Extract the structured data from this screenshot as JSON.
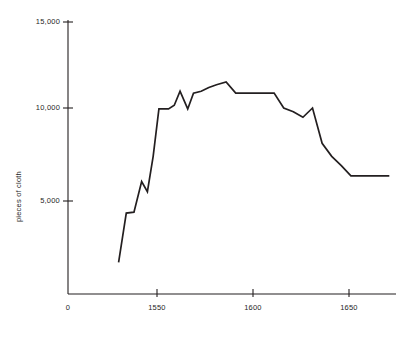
{
  "chart_data": {
    "type": "line",
    "title": "",
    "subtitle": "",
    "xlabel": "",
    "ylabel": "pieces of cloth",
    "xlim": [
      1528,
      1672
    ],
    "ylim": [
      0,
      15000
    ],
    "grid": false,
    "legend": null,
    "x_ticks": [
      {
        "value": 0,
        "label": "0"
      },
      {
        "value": 1550,
        "label": "1550"
      },
      {
        "value": 1600,
        "label": "1600"
      },
      {
        "value": 1650,
        "label": "1650"
      }
    ],
    "y_ticks": [
      {
        "value": 5000,
        "label": "5,000"
      },
      {
        "value": 10000,
        "label": "10,000"
      },
      {
        "value": 15000,
        "label": "15,000"
      }
    ],
    "series": [
      {
        "name": "pieces of cloth",
        "color": "#231f20",
        "x": [
          1530,
          1534,
          1538,
          1542,
          1545,
          1548,
          1551,
          1556,
          1559,
          1562,
          1566,
          1569,
          1573,
          1577,
          1581,
          1586,
          1591,
          1596,
          1601,
          1606,
          1611,
          1616,
          1621,
          1626,
          1631,
          1636,
          1641,
          1646,
          1651,
          1656,
          1661,
          1666,
          1671
        ],
        "y": [
          1700,
          4350,
          4400,
          6050,
          5500,
          7400,
          9950,
          9950,
          10150,
          10900,
          9950,
          10800,
          10900,
          11100,
          11250,
          11400,
          10800,
          10800,
          10800,
          10800,
          10800,
          10000,
          9800,
          9500,
          10000,
          8100,
          7400,
          6900,
          6350,
          6350,
          6350,
          6350,
          6350
        ]
      }
    ]
  },
  "axis": {
    "y_title": "pieces of cloth",
    "origin_label": "0"
  }
}
